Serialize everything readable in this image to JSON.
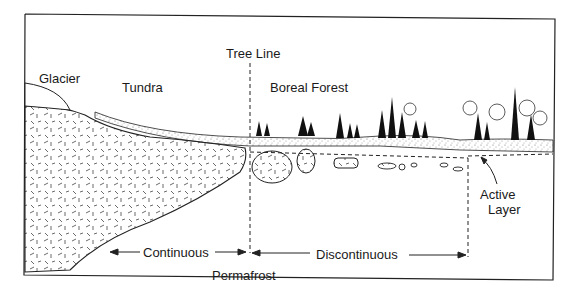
{
  "diagram": {
    "labels": {
      "glacier": "Glacier",
      "tundra": "Tundra",
      "tree_line": "Tree Line",
      "boreal_forest": "Boreal Forest",
      "continuous": "Continuous",
      "permafrost": "Permafrost",
      "discontinuous": "Discontinuous",
      "active_layer_1": "Active",
      "active_layer_2": "Layer"
    },
    "colors": {
      "ink": "#1a1a1a",
      "background": "#ffffff",
      "stipple": "#999999"
    }
  }
}
